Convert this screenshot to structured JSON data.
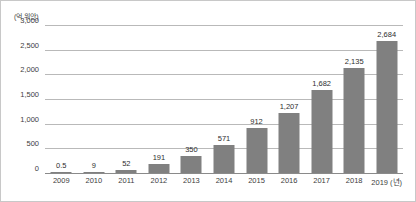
{
  "chart_data": {
    "type": "bar",
    "title": "",
    "subtitle": "",
    "unit_label": "(억 위안)",
    "xlabel": "(년)",
    "ylabel": "",
    "categories": [
      "2009",
      "2010",
      "2011",
      "2012",
      "2013",
      "2014",
      "2015",
      "2016",
      "2017",
      "2018",
      "2019"
    ],
    "values": [
      0.5,
      9,
      52,
      191,
      350,
      571,
      912,
      1207,
      1682,
      2135,
      2684
    ],
    "value_labels": [
      "0.5",
      "9",
      "52",
      "191",
      "350",
      "571",
      "912",
      "1,207",
      "1,682",
      "2,135",
      "2,684"
    ],
    "ylim": [
      0,
      3000
    ],
    "yticks": [
      0,
      500,
      1000,
      1500,
      2000,
      2500,
      3000
    ],
    "ytick_labels": [
      "0",
      "500",
      "1,000",
      "1,500",
      "2,000",
      "2,500",
      "3,000"
    ],
    "grid": true,
    "legend": false,
    "legend_position": "none",
    "bar_color": "#808080",
    "gridline_color": "#b9b9b9",
    "axis_color": "#8a8a8a",
    "text_color": "#3d3d3d",
    "background_color": "#ffffff",
    "last_category_suffix": "(년)"
  }
}
